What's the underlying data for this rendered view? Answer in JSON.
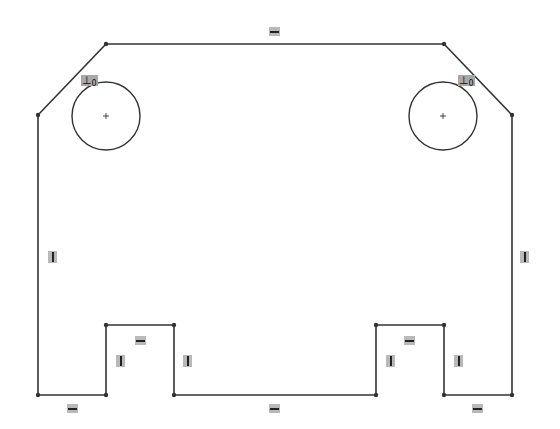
{
  "sketch": {
    "stroke_color": "#333333",
    "relation_bg": "#b9b9b9",
    "lines": [
      {
        "id": "top",
        "x1": 106,
        "y1": 44,
        "x2": 444,
        "y2": 44
      },
      {
        "id": "chamfer-left",
        "x1": 106,
        "y1": 44,
        "x2": 38,
        "y2": 115
      },
      {
        "id": "chamfer-right",
        "x1": 444,
        "y1": 44,
        "x2": 512,
        "y2": 115
      },
      {
        "id": "left-side",
        "x1": 38,
        "y1": 115,
        "x2": 38,
        "y2": 395
      },
      {
        "id": "right-side",
        "x1": 512,
        "y1": 115,
        "x2": 512,
        "y2": 395
      },
      {
        "id": "bottom-left",
        "x1": 38,
        "y1": 395,
        "x2": 106,
        "y2": 395
      },
      {
        "id": "notch-left-l",
        "x1": 106,
        "y1": 395,
        "x2": 106,
        "y2": 325
      },
      {
        "id": "notch-left-top",
        "x1": 106,
        "y1": 325,
        "x2": 174,
        "y2": 325
      },
      {
        "id": "notch-left-r",
        "x1": 174,
        "y1": 325,
        "x2": 174,
        "y2": 395
      },
      {
        "id": "bottom-mid",
        "x1": 174,
        "y1": 395,
        "x2": 376,
        "y2": 395
      },
      {
        "id": "notch-right-l",
        "x1": 376,
        "y1": 395,
        "x2": 376,
        "y2": 325
      },
      {
        "id": "notch-right-top",
        "x1": 376,
        "y1": 325,
        "x2": 444,
        "y2": 325
      },
      {
        "id": "notch-right-r",
        "x1": 444,
        "y1": 325,
        "x2": 444,
        "y2": 395
      },
      {
        "id": "bottom-right",
        "x1": 444,
        "y1": 395,
        "x2": 512,
        "y2": 395
      }
    ],
    "circles": [
      {
        "id": "hole-left",
        "cx": 106,
        "cy": 116,
        "r": 34
      },
      {
        "id": "hole-right",
        "cx": 443,
        "cy": 116,
        "r": 34
      }
    ],
    "relations": [
      {
        "type": "horizontal",
        "x": 269,
        "y": 27
      },
      {
        "type": "vertical",
        "x": 48,
        "y": 251
      },
      {
        "type": "vertical",
        "x": 520,
        "y": 251
      },
      {
        "type": "horizontal",
        "x": 135,
        "y": 336
      },
      {
        "type": "vertical",
        "x": 116,
        "y": 355
      },
      {
        "type": "vertical",
        "x": 183,
        "y": 355
      },
      {
        "type": "horizontal",
        "x": 67,
        "y": 404
      },
      {
        "type": "horizontal",
        "x": 269,
        "y": 404
      },
      {
        "type": "horizontal",
        "x": 404,
        "y": 336
      },
      {
        "type": "vertical",
        "x": 386,
        "y": 355
      },
      {
        "type": "vertical",
        "x": 454,
        "y": 355
      },
      {
        "type": "horizontal",
        "x": 472,
        "y": 404
      }
    ],
    "tangent_relations": [
      {
        "x": 81,
        "y": 75,
        "symbol": "⊥",
        "sub": "0"
      },
      {
        "x": 458,
        "y": 75,
        "symbol": "⊥",
        "sub": "0"
      }
    ]
  }
}
